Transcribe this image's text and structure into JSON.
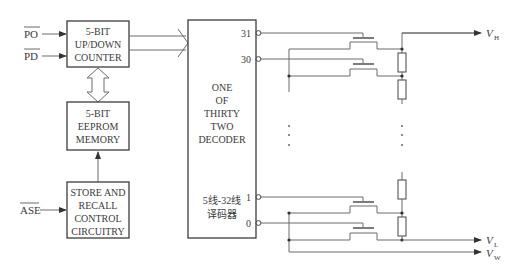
{
  "diagram": {
    "type": "block-diagram + circuit",
    "inputs": [
      {
        "id": "po",
        "label": "PO",
        "overline": true
      },
      {
        "id": "pd",
        "label": "PD",
        "overline": true
      },
      {
        "id": "ase",
        "label": "ASE",
        "overline": true
      }
    ],
    "blocks": {
      "counter": {
        "lines": [
          "5-BIT",
          "UP/DOWN",
          "COUNTER"
        ]
      },
      "eeprom": {
        "lines": [
          "5-BIT",
          "EEPROM",
          "MEMORY"
        ]
      },
      "store": {
        "lines": [
          "STORE AND",
          "RECALL",
          "CONTROL",
          "CIRCUITRY"
        ]
      },
      "decoder": {
        "lines": [
          "ONE",
          "OF",
          "THIRTY",
          "TWO",
          "DECODER"
        ],
        "cn_lines": [
          "5线-32线",
          "译码器"
        ],
        "outputs": [
          "31",
          "30",
          "1",
          "0"
        ]
      }
    },
    "terminals": {
      "vh": {
        "main": "V",
        "sub": "H"
      },
      "vl": {
        "main": "V",
        "sub": "L"
      },
      "vw": {
        "main": "V",
        "sub": "W"
      }
    },
    "ellipsis": "⋮"
  }
}
